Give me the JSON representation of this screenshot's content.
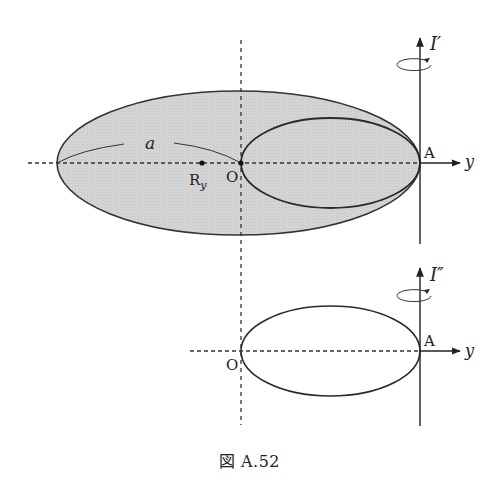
{
  "figure": {
    "caption": "図 A.52",
    "top_diagram": {
      "axis_label": "I′",
      "point_A": "A",
      "point_O": "O",
      "point_Ry": "R",
      "point_Ry_sub": "y",
      "distance_label": "a",
      "y_axis_label": "y",
      "fill_color": "#d4d4d4",
      "stroke_color": "#333333"
    },
    "bottom_diagram": {
      "axis_label": "I″",
      "point_A": "A",
      "point_O": "O",
      "y_axis_label": "y"
    }
  }
}
